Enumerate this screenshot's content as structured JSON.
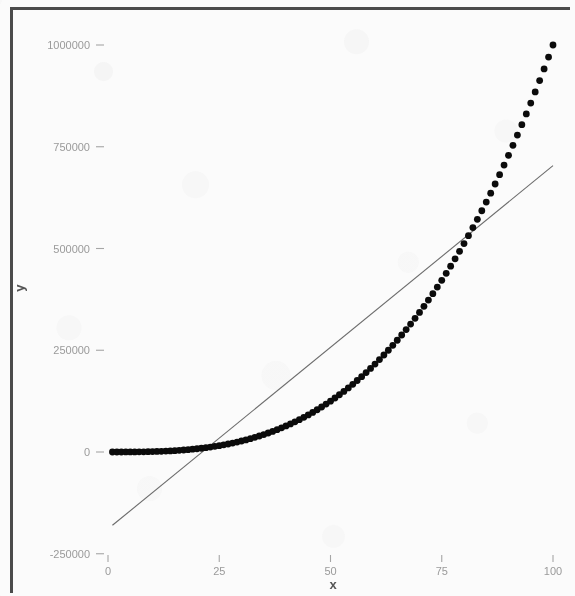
{
  "figure": {
    "background_color": "#fbfbfb",
    "frame_color": "#4b4b4b",
    "point_color": "#0b0b0b",
    "line_color": "#6b6b6b",
    "tick_label_color": "#9a9a9a",
    "axis_title_color": "#555555"
  },
  "axes": {
    "x_title": "x",
    "y_title": "y",
    "x_ticks": [
      "0",
      "25",
      "50",
      "75",
      "100"
    ],
    "y_ticks": [
      "1000000",
      "750000",
      "500000",
      "250000",
      "0",
      "-250000"
    ]
  },
  "chart_data": {
    "type": "scatter",
    "title": "",
    "subtitle": "",
    "xlabel": "x",
    "ylabel": "y",
    "grid": false,
    "legend": "none",
    "xlim": [
      -2,
      104
    ],
    "ylim": [
      -290000,
      1075000
    ],
    "x_tick_values": [
      0,
      25,
      50,
      75,
      100
    ],
    "y_tick_values": [
      1000000,
      750000,
      500000,
      250000,
      0,
      -250000
    ],
    "series": [
      {
        "name": "y = x^3",
        "type": "scatter",
        "marker": "filled-circle",
        "color": "#0b0b0b",
        "formula": "y = x^3",
        "x": [
          1,
          2,
          3,
          4,
          5,
          6,
          7,
          8,
          9,
          10,
          11,
          12,
          13,
          14,
          15,
          16,
          17,
          18,
          19,
          20,
          21,
          22,
          23,
          24,
          25,
          26,
          27,
          28,
          29,
          30,
          31,
          32,
          33,
          34,
          35,
          36,
          37,
          38,
          39,
          40,
          41,
          42,
          43,
          44,
          45,
          46,
          47,
          48,
          49,
          50,
          51,
          52,
          53,
          54,
          55,
          56,
          57,
          58,
          59,
          60,
          61,
          62,
          63,
          64,
          65,
          66,
          67,
          68,
          69,
          70,
          71,
          72,
          73,
          74,
          75,
          76,
          77,
          78,
          79,
          80,
          81,
          82,
          83,
          84,
          85,
          86,
          87,
          88,
          89,
          90,
          91,
          92,
          93,
          94,
          95,
          96,
          97,
          98,
          99,
          100
        ],
        "values": [
          1,
          8,
          27,
          64,
          125,
          216,
          343,
          512,
          729,
          1000,
          1331,
          1728,
          2197,
          2744,
          3375,
          4096,
          4913,
          5832,
          6859,
          8000,
          9261,
          10648,
          12167,
          13824,
          15625,
          17576,
          19683,
          21952,
          24389,
          27000,
          29791,
          32768,
          35937,
          39304,
          42875,
          46656,
          50653,
          54872,
          59319,
          64000,
          68921,
          74088,
          79507,
          85184,
          91125,
          97336,
          103823,
          110592,
          117649,
          125000,
          132651,
          140608,
          148877,
          157464,
          166375,
          175616,
          185193,
          195112,
          205379,
          216000,
          226981,
          238328,
          250047,
          262144,
          274625,
          287496,
          300763,
          314432,
          328509,
          343000,
          357911,
          373248,
          389017,
          405224,
          421875,
          438976,
          456533,
          474552,
          493039,
          512000,
          531441,
          551368,
          571787,
          592704,
          614125,
          636056,
          658503,
          681472,
          704969,
          729000,
          753571,
          778688,
          804357,
          830584,
          857375,
          884736,
          912673,
          941192,
          970299,
          1000000
        ]
      },
      {
        "name": "linear fit",
        "type": "line",
        "color": "#6b6b6b",
        "slope": 8925,
        "intercept": -189000,
        "x": [
          1,
          100
        ],
        "values": [
          -180075,
          703500
        ]
      }
    ]
  }
}
